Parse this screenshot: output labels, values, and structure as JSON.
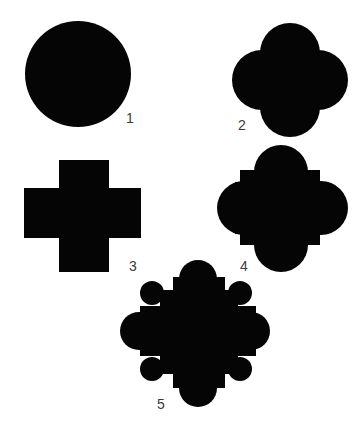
{
  "figure": {
    "fill_color": "#050505",
    "label_color": "#3a3a3a",
    "shapes": [
      {
        "id": 1,
        "label": "1",
        "description": "circle"
      },
      {
        "id": 2,
        "label": "2",
        "description": "four overlapping circles (quatrefoil)"
      },
      {
        "id": 3,
        "label": "3",
        "description": "cross (plus shape)"
      },
      {
        "id": 4,
        "label": "4",
        "description": "square with four semicircular lobes"
      },
      {
        "id": 5,
        "label": "5",
        "description": "cross with lobes and diagonal small circles"
      }
    ]
  }
}
